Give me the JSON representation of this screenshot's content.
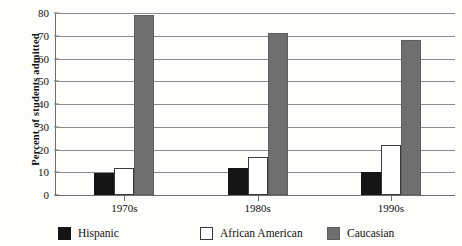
{
  "chart_data": {
    "type": "bar",
    "title": "",
    "subtitle": "",
    "xlabel": "",
    "ylabel": "Percent of students admitted",
    "categories": [
      "1970s",
      "1980s",
      "1990s"
    ],
    "ylim": [
      0,
      80
    ],
    "yticks": [
      0,
      10,
      20,
      30,
      40,
      50,
      60,
      70,
      80
    ],
    "grid": true,
    "legend_position": "bottom",
    "series": [
      {
        "name": "Hispanic",
        "color": "#151515",
        "values": [
          9.5,
          12,
          10
        ]
      },
      {
        "name": "African American",
        "color": "#ffffff",
        "values": [
          12,
          16.5,
          22
        ]
      },
      {
        "name": "Caucasian",
        "color": "#6f6f6f",
        "values": [
          79,
          71,
          68
        ]
      }
    ]
  },
  "axis": {
    "y_title": "Percent of students admitted",
    "y_tick_labels": [
      "0",
      "10",
      "20",
      "30",
      "40",
      "50",
      "60",
      "70",
      "80"
    ],
    "x_tick_labels": [
      "1970s",
      "1980s",
      "1990s"
    ]
  },
  "legend": {
    "items": [
      {
        "label": "Hispanic",
        "swatch": "black-square-swatch"
      },
      {
        "label": "African American",
        "swatch": "white-square-swatch"
      },
      {
        "label": "Caucasian",
        "swatch": "gray-square-swatch"
      }
    ]
  },
  "colors": {
    "black": "#151515",
    "white": "#ffffff",
    "gray": "#6f6f6f",
    "gridline": "#8c8c8c",
    "axis": "#6e6e6e",
    "background": "#fdfdfb"
  }
}
